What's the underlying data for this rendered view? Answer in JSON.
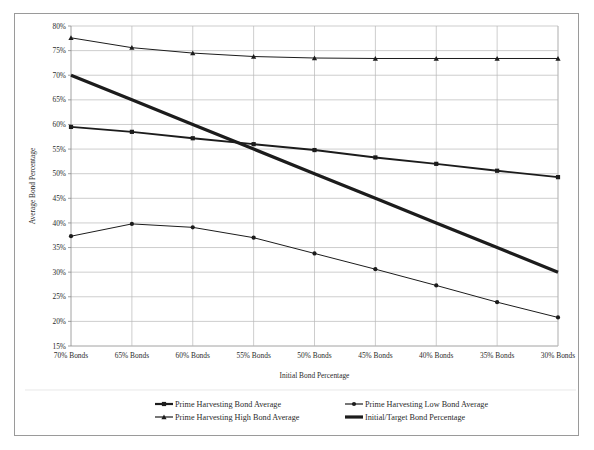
{
  "chart_data": {
    "type": "line",
    "title": "",
    "xlabel": "Initial Bond Percentage",
    "ylabel": "Average Bond Percentage",
    "categories": [
      "70% Bonds",
      "65% Bonds",
      "60% Bonds",
      "55% Bonds",
      "50% Bonds",
      "45% Bonds",
      "40% Bonds",
      "35% Bonds",
      "30% Bonds"
    ],
    "ylim": [
      15,
      80
    ],
    "ytick_step": 5,
    "ytick_labels": [
      "80%",
      "75%",
      "70%",
      "65%",
      "60%",
      "55%",
      "50%",
      "45%",
      "40%",
      "35%",
      "30%",
      "25%",
      "20%",
      "15%"
    ],
    "ytick_values": [
      80,
      75,
      70,
      65,
      60,
      55,
      50,
      45,
      40,
      35,
      30,
      25,
      20,
      15
    ],
    "grid": true,
    "legend_position": "bottom",
    "series": [
      {
        "name": "Prime Harvesting Bond Average",
        "marker": "square",
        "color": "#1c1c1c",
        "width": 1.9,
        "values": [
          59.5,
          58.5,
          57.2,
          56.0,
          54.8,
          53.3,
          52.0,
          50.6,
          49.3
        ]
      },
      {
        "name": "Prime Harvesting Low Bond Average",
        "marker": "circle",
        "color": "#1c1c1c",
        "width": 1.0,
        "values": [
          37.3,
          39.8,
          39.1,
          37.0,
          33.8,
          30.6,
          27.3,
          23.9,
          20.8
        ]
      },
      {
        "name": "Prime Harvesting High Bond Average",
        "marker": "triangle",
        "color": "#1c1c1c",
        "width": 1.0,
        "values": [
          77.6,
          75.6,
          74.5,
          73.8,
          73.5,
          73.4,
          73.4,
          73.4,
          73.4
        ]
      },
      {
        "name": "Initial/Target Bond Percentage",
        "marker": "none",
        "color": "#2e2e2e",
        "width": 3.2,
        "values": [
          70,
          65,
          60,
          55,
          50,
          45,
          40,
          35,
          30
        ]
      }
    ]
  },
  "legend": {
    "items": [
      {
        "label": "Prime Harvesting Bond Average",
        "marker": "square"
      },
      {
        "label": "Prime Harvesting Low Bond Average",
        "marker": "circle"
      },
      {
        "label": "Prime Harvesting High Bond Average",
        "marker": "triangle"
      },
      {
        "label": "Initial/Target Bond Percentage",
        "marker": "line"
      }
    ]
  },
  "colors": {
    "plot_line": "#1c1c1c",
    "gridline": "#b8b8b8",
    "axis": "#8a8a8a",
    "border": "#9a9a9a",
    "background": "#ffffff"
  }
}
